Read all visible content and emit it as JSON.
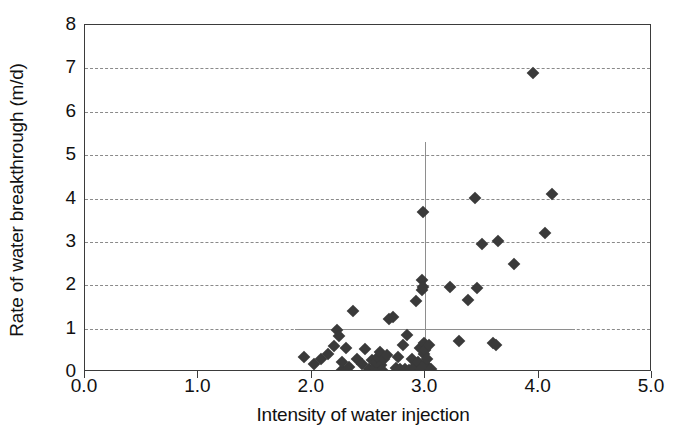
{
  "chart_data": {
    "type": "scatter",
    "title": "",
    "xlabel": "Intensity of water injection",
    "ylabel": "Rate of water breakthrough (m/d)",
    "xlim": [
      0.0,
      5.0
    ],
    "ylim": [
      0,
      8
    ],
    "xticks": [
      "0.0",
      "1.0",
      "2.0",
      "3.0",
      "4.0",
      "5.0"
    ],
    "xtick_values": [
      0.0,
      1.0,
      2.0,
      3.0,
      4.0,
      5.0
    ],
    "yticks": [
      "0",
      "1",
      "2",
      "3",
      "4",
      "5",
      "6",
      "7",
      "8"
    ],
    "ytick_values": [
      0,
      1,
      2,
      3,
      4,
      5,
      6,
      7,
      8
    ],
    "grid": "horizontal-dashed",
    "legend": "none",
    "marker": "diamond",
    "marker_color": "#3a3a3a",
    "reference_lines": [
      {
        "orientation": "vertical",
        "value": 3.0,
        "x_start": 3.0,
        "y_start": 0,
        "y_end": 5.3,
        "color": "#8e8e8e"
      },
      {
        "orientation": "horizontal",
        "value": 1.0,
        "x_start": 1.85,
        "x_end": 4.32,
        "color": "#8e8e8e"
      }
    ],
    "points": [
      [
        1.93,
        0.35
      ],
      [
        2.02,
        0.18
      ],
      [
        2.08,
        0.3
      ],
      [
        2.14,
        0.42
      ],
      [
        2.2,
        0.6
      ],
      [
        2.22,
        0.97
      ],
      [
        2.24,
        0.83
      ],
      [
        2.27,
        0.05
      ],
      [
        2.27,
        0.22
      ],
      [
        2.3,
        0.55
      ],
      [
        2.33,
        0.12
      ],
      [
        2.36,
        1.4
      ],
      [
        2.4,
        0.3
      ],
      [
        2.44,
        0.18
      ],
      [
        2.47,
        0.52
      ],
      [
        2.5,
        0.08
      ],
      [
        2.53,
        0.27
      ],
      [
        2.56,
        0.1
      ],
      [
        2.57,
        0.22
      ],
      [
        2.58,
        0.34
      ],
      [
        2.6,
        0.45
      ],
      [
        2.61,
        0.16
      ],
      [
        2.62,
        0.05
      ],
      [
        2.64,
        0.3
      ],
      [
        2.66,
        0.4
      ],
      [
        2.68,
        1.23
      ],
      [
        2.72,
        1.26
      ],
      [
        2.74,
        0.1
      ],
      [
        2.76,
        0.35
      ],
      [
        2.78,
        0.06
      ],
      [
        2.8,
        0.62
      ],
      [
        2.82,
        0.08
      ],
      [
        2.84,
        0.86
      ],
      [
        2.86,
        0.05
      ],
      [
        2.88,
        0.3
      ],
      [
        2.9,
        0.12
      ],
      [
        2.92,
        1.63
      ],
      [
        2.94,
        0.22
      ],
      [
        2.95,
        0.55
      ],
      [
        2.96,
        0.07
      ],
      [
        2.97,
        1.9
      ],
      [
        2.97,
        2.13
      ],
      [
        2.98,
        1.95
      ],
      [
        2.98,
        3.68
      ],
      [
        2.99,
        0.42
      ],
      [
        2.99,
        0.68
      ],
      [
        3.0,
        0.18
      ],
      [
        3.0,
        0.5
      ],
      [
        3.02,
        0.3
      ],
      [
        3.03,
        0.62
      ],
      [
        3.05,
        0.08
      ],
      [
        3.22,
        1.96
      ],
      [
        3.3,
        0.72
      ],
      [
        3.38,
        1.66
      ],
      [
        3.44,
        4.02
      ],
      [
        3.46,
        1.93
      ],
      [
        3.5,
        2.94
      ],
      [
        3.6,
        0.68
      ],
      [
        3.62,
        0.62
      ],
      [
        3.64,
        3.02
      ],
      [
        3.78,
        2.48
      ],
      [
        3.95,
        6.9
      ],
      [
        4.06,
        3.2
      ],
      [
        4.12,
        4.1
      ]
    ]
  }
}
